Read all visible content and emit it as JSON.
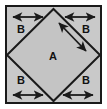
{
  "figure": {
    "type": "geometry-diagram",
    "canvas": {
      "width": 107,
      "height": 109
    },
    "colors": {
      "page_background": "#ffffff",
      "shape_fill": "#c9c9c9",
      "diamond_fill": "#c4c4c4",
      "stroke": "#1a1a1a",
      "label_text": "#111111"
    },
    "outer_square": {
      "name": "outer-square",
      "x": 6,
      "y": 6,
      "width": 95,
      "height": 97,
      "stroke_width": 2
    },
    "diamond": {
      "name": "inscribed-diamond",
      "label": "A",
      "vertices": "53.5,9 100,55 53.5,101 7,55",
      "stroke_width": 2,
      "label_x": 53,
      "label_y": 57
    },
    "corner_regions": [
      {
        "id": "top-left",
        "label": "B",
        "label_x": 21,
        "label_y": 30
      },
      {
        "id": "top-right",
        "label": "B",
        "label_x": 86,
        "label_y": 30
      },
      {
        "id": "bottom-left",
        "label": "B",
        "label_x": 21,
        "label_y": 81
      },
      {
        "id": "bottom-right",
        "label": "B",
        "label_x": 86,
        "label_y": 81
      }
    ],
    "arrows": [
      {
        "id": "top-left-width-arrow",
        "orientation": "horizontal",
        "x1": 13,
        "y1": 17,
        "x2": 43,
        "y2": 17
      },
      {
        "id": "top-right-width-arrow",
        "orientation": "horizontal",
        "x1": 65,
        "y1": 17,
        "x2": 95,
        "y2": 17
      },
      {
        "id": "bottom-left-width-arrow",
        "orientation": "horizontal",
        "x1": 13,
        "y1": 95,
        "x2": 43,
        "y2": 95
      },
      {
        "id": "bottom-right-width-arrow",
        "orientation": "horizontal",
        "x1": 63,
        "y1": 95,
        "x2": 93,
        "y2": 95
      },
      {
        "id": "diamond-side-arrow",
        "orientation": "diagonal",
        "x1": 59,
        "y1": 23,
        "x2": 86,
        "y2": 51
      }
    ],
    "labels": {
      "inner_region": "A",
      "corner_region": "B"
    }
  }
}
